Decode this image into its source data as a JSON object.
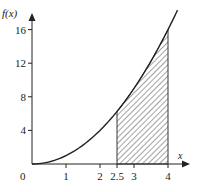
{
  "chart_data": {
    "type": "area",
    "title": "",
    "function": "f(x) = x^2",
    "xlabel": "x",
    "ylabel": "f(x)",
    "xlim": [
      0,
      4.3
    ],
    "ylim": [
      0,
      16.5
    ],
    "x_ticks": [
      {
        "value": 0,
        "label": "0"
      },
      {
        "value": 1,
        "label": "1"
      },
      {
        "value": 2,
        "label": "2"
      },
      {
        "value": 2.5,
        "label": "2.5"
      },
      {
        "value": 3,
        "label": "3"
      },
      {
        "value": 4,
        "label": "4"
      }
    ],
    "y_ticks": [
      {
        "value": 4,
        "label": "4"
      },
      {
        "value": 8,
        "label": "8"
      },
      {
        "value": 12,
        "label": "12"
      },
      {
        "value": 16,
        "label": "16"
      }
    ],
    "series": [
      {
        "name": "f(x)",
        "x": [
          0,
          0.5,
          1,
          1.5,
          2,
          2.5,
          3,
          3.5,
          4,
          4.25
        ],
        "values": [
          0,
          0.25,
          1,
          2.25,
          4,
          6.25,
          9,
          12.25,
          16,
          18.06
        ]
      }
    ],
    "shaded_region": {
      "from": 2.5,
      "to": 4,
      "style": "hatched",
      "description": "area under f(x) between x = 2.5 and x = 4"
    },
    "grid": false,
    "legend": null
  },
  "labels": {
    "y_axis": "f(x)",
    "x_axis": "x",
    "origin": "0"
  },
  "colors": {
    "ink": "#222222",
    "background": "#ffffff"
  }
}
